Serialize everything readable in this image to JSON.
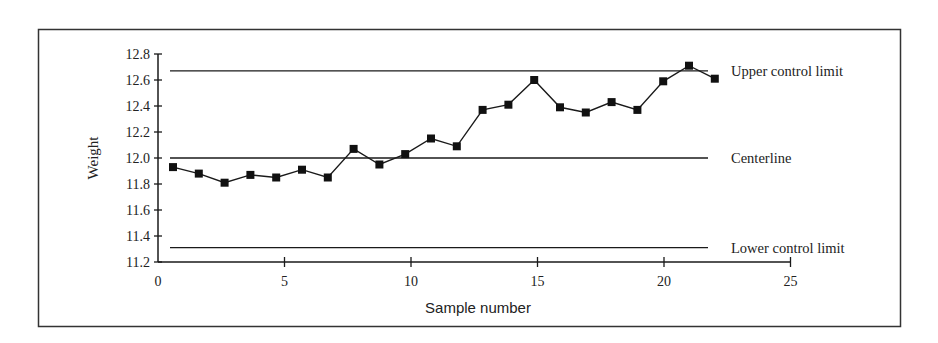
{
  "chart_data": {
    "type": "line",
    "title": "",
    "xlabel": "Sample number",
    "ylabel": "Weight",
    "xlim": [
      0,
      25
    ],
    "ylim": [
      11.2,
      12.8
    ],
    "x_ticks": [
      0,
      5,
      10,
      15,
      20,
      25
    ],
    "y_ticks": [
      "11.2",
      "11.4",
      "11.6",
      "11.8",
      "12.0",
      "12.2",
      "12.4",
      "12.6",
      "12.8"
    ],
    "grid": false,
    "legend": "none",
    "series": [
      {
        "name": "Sample weight",
        "marker": "square",
        "x": [
          1,
          2,
          3,
          4,
          5,
          6,
          7,
          8,
          9,
          10,
          11,
          12,
          13,
          14,
          15,
          16,
          17,
          18,
          19,
          20,
          21,
          22
        ],
        "values": [
          11.93,
          11.88,
          11.81,
          11.87,
          11.85,
          11.91,
          11.85,
          12.07,
          11.95,
          12.03,
          12.15,
          12.09,
          12.37,
          12.41,
          12.6,
          12.39,
          12.35,
          12.43,
          12.37,
          12.59,
          12.71,
          12.61
        ]
      }
    ],
    "reference_lines": [
      {
        "name": "Upper control limit",
        "label": "Upper control limit",
        "value": 12.67
      },
      {
        "name": "Centerline",
        "label": "Centerline",
        "value": 12.0
      },
      {
        "name": "Lower control limit",
        "label": "Lower control limit",
        "value": 11.31
      }
    ]
  },
  "colors": {
    "line": "#1a1a1a",
    "frame": "#333333",
    "background": "#ffffff"
  }
}
